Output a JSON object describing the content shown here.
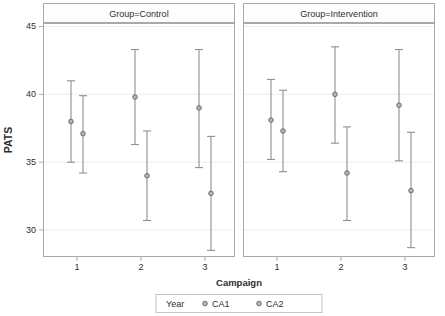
{
  "window": {
    "width": 445,
    "height": 316,
    "background": "#ffffff"
  },
  "chart_data": {
    "type": "scatter",
    "subtype": "paneled-interval-plot-with-error-bars",
    "ylabel": "PATS",
    "xlabel": "Campaign",
    "x_categories": [
      "1",
      "2",
      "3"
    ],
    "yticks": [
      30,
      35,
      40,
      45
    ],
    "ylim": [
      28,
      45.3
    ],
    "grid": "horizontal-only",
    "legend": {
      "title": "Year",
      "position": "bottom-center",
      "entries": [
        "CA1",
        "CA2"
      ]
    },
    "panels": [
      {
        "title": "Group=Control",
        "series": [
          {
            "name": "CA1",
            "points": [
              {
                "x": 1,
                "y": 38.0,
                "lo": 35.0,
                "hi": 41.0
              },
              {
                "x": 2,
                "y": 39.8,
                "lo": 36.3,
                "hi": 43.3
              },
              {
                "x": 3,
                "y": 39.0,
                "lo": 34.6,
                "hi": 43.3
              }
            ]
          },
          {
            "name": "CA2",
            "points": [
              {
                "x": 1,
                "y": 37.1,
                "lo": 34.2,
                "hi": 39.9
              },
              {
                "x": 2,
                "y": 34.0,
                "lo": 30.7,
                "hi": 37.3
              },
              {
                "x": 3,
                "y": 32.7,
                "lo": 28.5,
                "hi": 36.9
              }
            ]
          }
        ]
      },
      {
        "title": "Group=Intervention",
        "series": [
          {
            "name": "CA1",
            "points": [
              {
                "x": 1,
                "y": 38.1,
                "lo": 35.2,
                "hi": 41.1
              },
              {
                "x": 2,
                "y": 40.0,
                "lo": 36.4,
                "hi": 43.5
              },
              {
                "x": 3,
                "y": 39.2,
                "lo": 35.1,
                "hi": 43.3
              }
            ]
          },
          {
            "name": "CA2",
            "points": [
              {
                "x": 1,
                "y": 37.3,
                "lo": 34.3,
                "hi": 40.3
              },
              {
                "x": 2,
                "y": 34.2,
                "lo": 30.7,
                "hi": 37.6
              },
              {
                "x": 3,
                "y": 32.9,
                "lo": 28.7,
                "hi": 37.2
              }
            ]
          }
        ]
      }
    ],
    "colors": {
      "error_bar": "#8f8f8f",
      "marker_fill": "#b3b3b3",
      "marker_stroke": "#6f6f6f",
      "panel_border": "#a9a9a9",
      "gridline": "#ededed",
      "tick": "#a9a9a9",
      "text": "#2e2e2e",
      "header_fill": "#fdfdfd",
      "legend_border": "#c4c4c4"
    }
  }
}
